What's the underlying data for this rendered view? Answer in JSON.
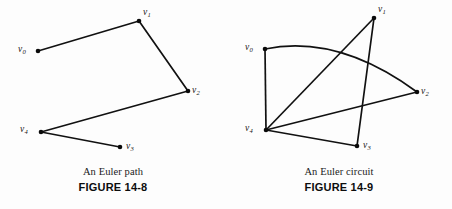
{
  "page": {
    "background_color": "#fdfdfd",
    "stroke_color": "#111111",
    "vertex_color": "#0a0a0a",
    "width": 452,
    "height": 209
  },
  "figures": [
    {
      "id": "figure-14-8",
      "caption_title": "An Euler path",
      "caption_figure": "FIGURE 14-8",
      "graph_type": "euler-path",
      "vertices": [
        {
          "id": "v0",
          "label_v": "v",
          "label_sub": "0",
          "x": 38,
          "y": 51,
          "label_x": 18,
          "label_y": 45
        },
        {
          "id": "v1",
          "label_v": "v",
          "label_sub": "1",
          "x": 139,
          "y": 21,
          "label_x": 143,
          "label_y": 8
        },
        {
          "id": "v2",
          "label_v": "v",
          "label_sub": "2",
          "x": 188,
          "y": 91,
          "label_x": 192,
          "label_y": 86
        },
        {
          "id": "v3",
          "label_v": "v",
          "label_sub": "3",
          "x": 120,
          "y": 147,
          "label_x": 126,
          "label_y": 142
        },
        {
          "id": "v4",
          "label_v": "v",
          "label_sub": "4",
          "x": 41,
          "y": 132,
          "label_x": 20,
          "label_y": 125
        }
      ],
      "edges": [
        {
          "from": "v0",
          "to": "v1",
          "shape": "straight"
        },
        {
          "from": "v1",
          "to": "v2",
          "shape": "straight"
        },
        {
          "from": "v2",
          "to": "v4",
          "shape": "straight"
        },
        {
          "from": "v4",
          "to": "v3",
          "shape": "straight"
        }
      ]
    },
    {
      "id": "figure-14-9",
      "caption_title": "An Euler circuit",
      "caption_figure": "FIGURE 14-9",
      "graph_type": "euler-circuit",
      "vertices": [
        {
          "id": "v0",
          "label_v": "v",
          "label_sub": "0",
          "x": 39,
          "y": 49,
          "label_x": 19,
          "label_y": 43
        },
        {
          "id": "v1",
          "label_v": "v",
          "label_sub": "1",
          "x": 148,
          "y": 18,
          "label_x": 152,
          "label_y": 5
        },
        {
          "id": "v2",
          "label_v": "v",
          "label_sub": "2",
          "x": 191,
          "y": 92,
          "label_x": 195,
          "label_y": 87
        },
        {
          "id": "v3",
          "label_v": "v",
          "label_sub": "3",
          "x": 131,
          "y": 146,
          "label_x": 137,
          "label_y": 141
        },
        {
          "id": "v4",
          "label_v": "v",
          "label_sub": "4",
          "x": 40,
          "y": 130,
          "label_x": 19,
          "label_y": 124
        }
      ],
      "edges": [
        {
          "from": "v0",
          "to": "v2",
          "shape": "curved",
          "curve_cx": 112,
          "curve_cy": 34
        },
        {
          "from": "v0",
          "to": "v4",
          "shape": "straight"
        },
        {
          "from": "v4",
          "to": "v1",
          "shape": "straight"
        },
        {
          "from": "v4",
          "to": "v2",
          "shape": "straight"
        },
        {
          "from": "v4",
          "to": "v3",
          "shape": "straight"
        },
        {
          "from": "v1",
          "to": "v3",
          "shape": "straight"
        }
      ]
    }
  ]
}
